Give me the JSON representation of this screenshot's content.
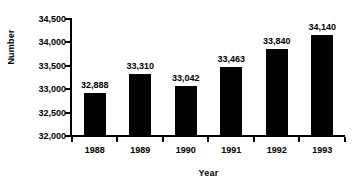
{
  "chart_data": {
    "type": "bar",
    "title": "",
    "categories": [
      "1988",
      "1989",
      "1990",
      "1991",
      "1992",
      "1993"
    ],
    "values": [
      32888,
      33310,
      33042,
      33463,
      33840,
      34140
    ],
    "value_labels": [
      "32,888",
      "33,310",
      "33,042",
      "33,463",
      "33,840",
      "34,140"
    ],
    "xlabel": "Year",
    "ylabel": "Number",
    "ylim": [
      32000,
      34500
    ],
    "ytick_values": [
      34500,
      34000,
      33500,
      33000,
      32500,
      32000
    ],
    "ytick_labels": [
      "34,500",
      "34,000",
      "33,500",
      "33,000",
      "32,500",
      "32,000"
    ],
    "grid": false,
    "legend": false,
    "bar_color": "#000000",
    "background_color": "#ffffff",
    "axis_color": "#000000"
  }
}
